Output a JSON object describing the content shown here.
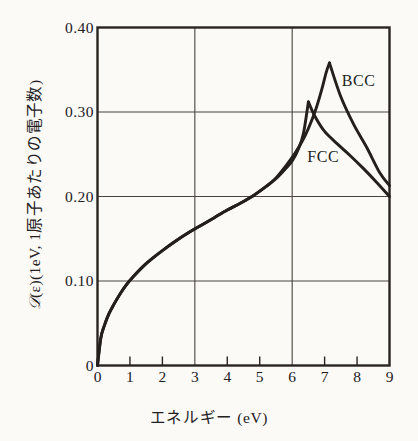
{
  "figure": {
    "paper_color": "#fbfaf7",
    "ink_color": "#241f1b",
    "grid_color": "#4a433c"
  },
  "axes": {
    "x_label": "エネルギー (eV)",
    "y_label_prefix": "𝒟",
    "y_label_rest": "(ε)(1eV, 1原子あたりの電子数)",
    "x_ticks": [
      "0",
      "1",
      "2",
      "3",
      "4",
      "5",
      "6",
      "7",
      "8",
      "9"
    ],
    "y_ticks": [
      "0",
      "0.10",
      "0.20",
      "0.30",
      "0.40"
    ]
  },
  "annotations": {
    "bcc_label": "BCC",
    "fcc_label": "FCC"
  },
  "chart_data": {
    "type": "line",
    "title": "",
    "xlabel": "エネルギー (eV)",
    "ylabel": "𝒟(ε)(1eV, 1原子あたりの電子数)",
    "xlim": [
      0,
      9
    ],
    "ylim": [
      0,
      0.4
    ],
    "xticks": [
      0,
      1,
      2,
      3,
      4,
      5,
      6,
      7,
      8,
      9
    ],
    "yticks": [
      0,
      0.1,
      0.2,
      0.3,
      0.4
    ],
    "ytick_labels": [
      "0",
      "0.10",
      "0.20",
      "0.30",
      "0.40"
    ],
    "grid": true,
    "grid_x": [
      3,
      6
    ],
    "grid_y": [
      0.1,
      0.2,
      0.3
    ],
    "legend": "inline-annotations",
    "series": [
      {
        "name": "FCC",
        "label_position": [
          6.9,
          0.245
        ],
        "x": [
          0.0,
          0.1,
          0.2,
          0.35,
          0.5,
          0.7,
          0.9,
          1.1,
          1.4,
          1.7,
          2.0,
          2.4,
          2.8,
          3.2,
          3.6,
          4.0,
          4.4,
          4.8,
          5.2,
          5.5,
          5.8,
          6.0,
          6.2,
          6.35,
          6.5,
          6.7,
          7.0,
          7.4,
          7.8,
          8.2,
          8.6,
          9.0
        ],
        "y": [
          0.0,
          0.032,
          0.046,
          0.061,
          0.072,
          0.085,
          0.096,
          0.105,
          0.117,
          0.127,
          0.136,
          0.147,
          0.157,
          0.166,
          0.175,
          0.184,
          0.192,
          0.201,
          0.212,
          0.221,
          0.233,
          0.242,
          0.257,
          0.275,
          0.312,
          0.295,
          0.277,
          0.262,
          0.248,
          0.233,
          0.217,
          0.2
        ]
      },
      {
        "name": "BCC",
        "label_position": [
          7.9,
          0.335
        ],
        "x": [
          0.0,
          0.1,
          0.2,
          0.35,
          0.5,
          0.7,
          0.9,
          1.1,
          1.4,
          1.7,
          2.0,
          2.4,
          2.8,
          3.2,
          3.6,
          4.0,
          4.4,
          4.8,
          5.2,
          5.5,
          5.8,
          6.1,
          6.4,
          6.7,
          6.9,
          7.05,
          7.15,
          7.5,
          7.9,
          8.3,
          8.7,
          9.0
        ],
        "y": [
          0.0,
          0.032,
          0.046,
          0.061,
          0.072,
          0.085,
          0.096,
          0.105,
          0.117,
          0.127,
          0.136,
          0.147,
          0.157,
          0.166,
          0.175,
          0.184,
          0.192,
          0.201,
          0.212,
          0.222,
          0.236,
          0.252,
          0.272,
          0.3,
          0.325,
          0.347,
          0.358,
          0.318,
          0.285,
          0.258,
          0.228,
          0.213
        ]
      }
    ]
  }
}
